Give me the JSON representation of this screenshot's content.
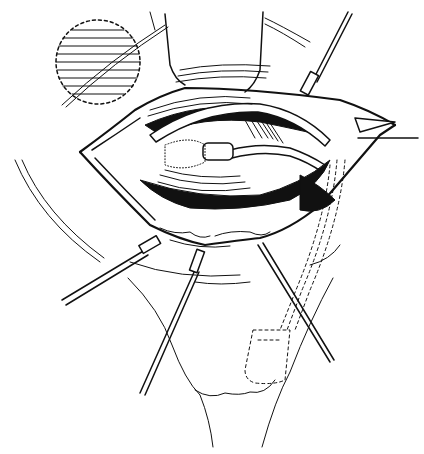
{
  "illustration": {
    "type": "surgical-line-drawing",
    "style": "black ink on white",
    "colors": {
      "ink": "#111111",
      "paper": "#ffffff"
    },
    "elements": {
      "inset_circle": "dashed circle with horizontal hatching, upper left",
      "retractors": [
        "upper-right",
        "lower-left",
        "lower-center",
        "lower-right"
      ],
      "pointer_arrow": "arrow line from right edge pointing into wound",
      "catheter": "dashed outline of tube and balloon, lower right"
    }
  }
}
